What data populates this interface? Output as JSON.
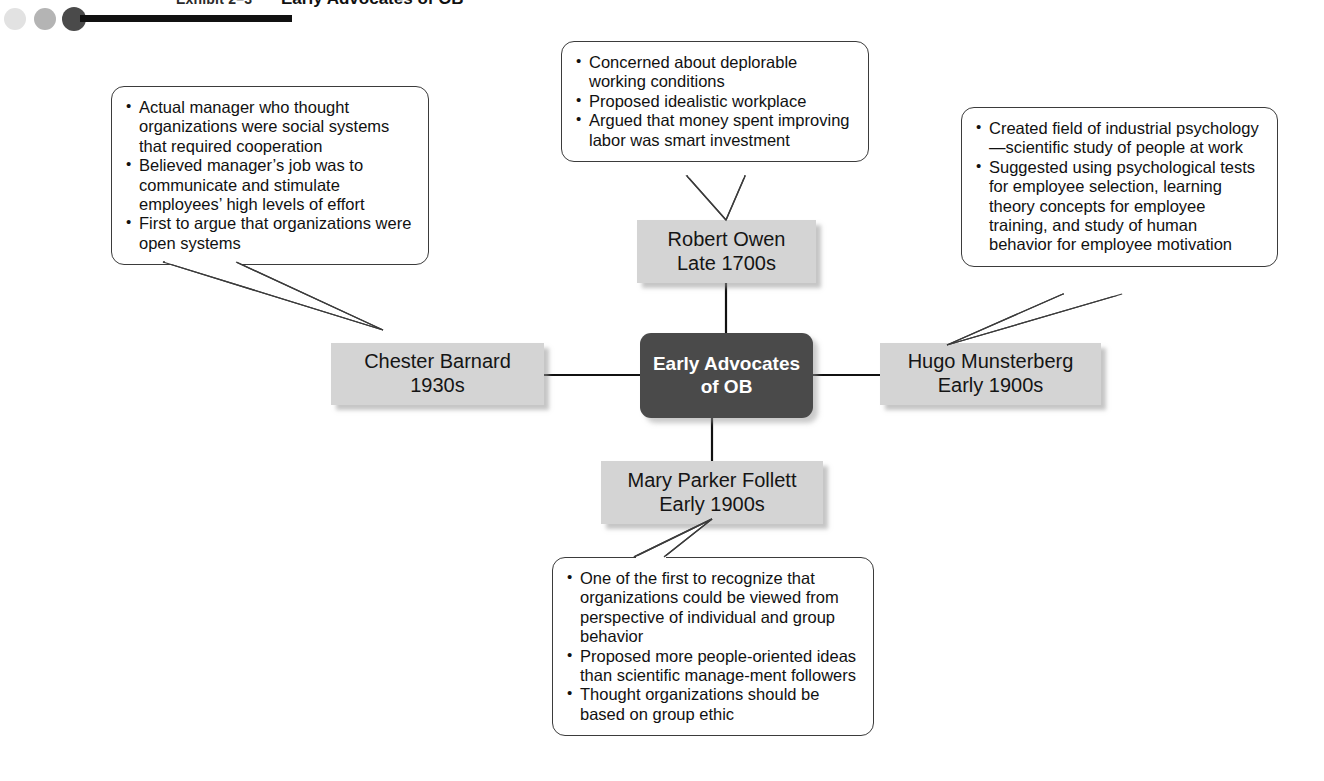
{
  "header": {
    "exhibit_label": "Exhibit 2–3",
    "title": "Early Advocates of OB",
    "dots": [
      "dot-light",
      "dot-medium",
      "dot-dark"
    ]
  },
  "diagram": {
    "center": {
      "label": "Early Advocates\nof OB",
      "color": "#4a4a4a",
      "text_color": "#ffffff"
    },
    "nodes": {
      "owen": {
        "label": "Robert Owen\nLate 1700s",
        "color": "#d4d4d4"
      },
      "barnard": {
        "label": "Chester Barnard\n1930s",
        "color": "#d4d4d4"
      },
      "munsterberg": {
        "label": "Hugo Munsterberg\nEarly 1900s",
        "color": "#d4d4d4"
      },
      "follett": {
        "label": "Mary Parker Follett\nEarly 1900s",
        "color": "#d4d4d4"
      }
    },
    "callouts": {
      "owen": [
        "Concerned about deplorable working conditions",
        "Proposed idealistic workplace",
        "Argued that money spent improving labor was smart investment"
      ],
      "barnard": [
        "Actual manager who thought organizations were social systems that required cooperation",
        "Believed manager’s job was to communicate and stimulate employees’ high levels of effort",
        "First to argue that organizations were open systems"
      ],
      "munsterberg": [
        "Created field of industrial psychology—scientific study of people at work",
        "Suggested using psychological tests for employee selection, learning theory concepts for employee training, and study of human behavior for employee motivation"
      ],
      "follett": [
        "One of the first to recognize that organizations could be viewed from perspective of individual and group behavior",
        "Proposed more people-oriented ideas than scientific manage-ment followers",
        "Thought organizations should be based on group ethic"
      ]
    }
  }
}
